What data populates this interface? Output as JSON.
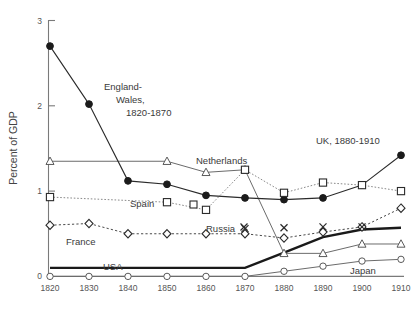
{
  "chart_data": {
    "type": "line",
    "title": "",
    "xlabel": "",
    "ylabel": "Percent of GDP",
    "x": [
      1820,
      1830,
      1840,
      1850,
      1860,
      1870,
      1880,
      1890,
      1900,
      1910
    ],
    "xticklabels": [
      "1820",
      "1830",
      "1840",
      "1850",
      "1860",
      "1870",
      "1880",
      "1890",
      "1900",
      "1910"
    ],
    "yticklabels": [
      "0",
      "1",
      "2",
      "3"
    ],
    "yticks": [
      0,
      1,
      2,
      3
    ],
    "ylim": [
      0,
      3
    ],
    "xlim": [
      1820,
      1910
    ],
    "grid": false,
    "legend_position": "inline-annotations",
    "series": [
      {
        "name": "England-Wales / UK",
        "marker": "filled-circle",
        "linestyle": "solid",
        "x": [
          1820,
          1830,
          1840,
          1850,
          1860,
          1870,
          1880,
          1890,
          1900,
          1910
        ],
        "values": [
          2.7,
          2.02,
          1.12,
          1.08,
          0.95,
          0.92,
          0.9,
          0.92,
          1.07,
          1.42
        ]
      },
      {
        "name": "Netherlands",
        "marker": "open-triangle",
        "linestyle": "thin-solid",
        "x": [
          1820,
          1850,
          1860,
          1870,
          1880,
          1890,
          1900,
          1910
        ],
        "values": [
          1.35,
          1.35,
          1.22,
          1.25,
          0.27,
          0.27,
          0.38,
          0.38
        ]
      },
      {
        "name": "Spain",
        "marker": "open-square",
        "linestyle": "dotted",
        "x": [
          1820,
          1850,
          1860,
          1870,
          1880,
          1890,
          1900,
          1910
        ],
        "values": [
          0.93,
          0.87,
          0.78,
          1.25,
          0.98,
          1.1,
          1.07,
          1.0
        ]
      },
      {
        "name": "France",
        "marker": "open-diamond",
        "linestyle": "dashed",
        "x": [
          1820,
          1830,
          1840,
          1850,
          1860,
          1870,
          1880,
          1890,
          1900,
          1910
        ],
        "values": [
          0.6,
          0.62,
          0.5,
          0.5,
          0.5,
          0.5,
          0.45,
          0.52,
          0.58,
          0.8
        ]
      },
      {
        "name": "Russia",
        "marker": "x",
        "linestyle": "none",
        "x": [
          1870,
          1880,
          1890,
          1900
        ],
        "values": [
          0.56,
          0.57,
          0.58,
          0.58
        ]
      },
      {
        "name": "USA",
        "marker": "none",
        "linestyle": "thick-solid",
        "x": [
          1820,
          1870,
          1880,
          1890,
          1900,
          1910
        ],
        "values": [
          0.1,
          0.1,
          0.28,
          0.46,
          0.55,
          0.57
        ]
      },
      {
        "name": "Japan",
        "marker": "open-circle",
        "linestyle": "thin-solid",
        "x": [
          1820,
          1830,
          1840,
          1850,
          1860,
          1870,
          1880,
          1890,
          1900,
          1910
        ],
        "values": [
          0.0,
          0.0,
          0.0,
          0.0,
          0.0,
          0.0,
          0.06,
          0.12,
          0.18,
          0.2
        ]
      }
    ],
    "annotations": [
      {
        "id": "england-wales",
        "text_lines": [
          "England-",
          "Wales,",
          "1820-1870"
        ]
      },
      {
        "id": "netherlands",
        "text_lines": [
          "Netherlands"
        ]
      },
      {
        "id": "spain",
        "text_lines": [
          "Spain"
        ]
      },
      {
        "id": "france",
        "text_lines": [
          "France"
        ]
      },
      {
        "id": "russia",
        "text_lines": [
          "Russia"
        ]
      },
      {
        "id": "usa",
        "text_lines": [
          "USA"
        ]
      },
      {
        "id": "japan",
        "text_lines": [
          "Japan"
        ]
      },
      {
        "id": "uk",
        "text_lines": [
          "UK, 1880-1910"
        ]
      }
    ]
  }
}
